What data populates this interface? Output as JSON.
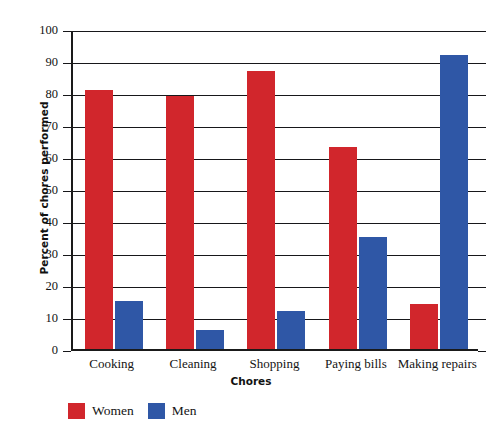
{
  "chart_data": {
    "type": "bar",
    "title": "",
    "subtitle": "",
    "xlabel": "Chores",
    "ylabel": "Percent of chores performed",
    "categories": [
      "Cooking",
      "Cleaning",
      "Shopping",
      "Paying bills",
      "Making repairs"
    ],
    "series": [
      {
        "name": "Women",
        "color": "#d1262c",
        "values": [
          81,
          79,
          87,
          63,
          14
        ]
      },
      {
        "name": "Men",
        "color": "#2f57a6",
        "values": [
          15,
          6,
          12,
          35,
          92
        ]
      }
    ],
    "ylim": [
      0,
      100
    ],
    "ytick_labels": [
      "100",
      "90",
      "80",
      "70",
      "60",
      "50",
      "40",
      "30",
      "20",
      "10",
      "0"
    ],
    "ytick_values": [
      100,
      90,
      80,
      70,
      60,
      50,
      40,
      30,
      20,
      10,
      0
    ],
    "grid": true,
    "grid_axis": "y",
    "legend_position": "bottom-left",
    "legend": [
      "Women",
      "Men"
    ]
  },
  "colors": {
    "women": "#d1262c",
    "men": "#2f57a6",
    "axis": "#17171a",
    "background": "#ffffff"
  }
}
